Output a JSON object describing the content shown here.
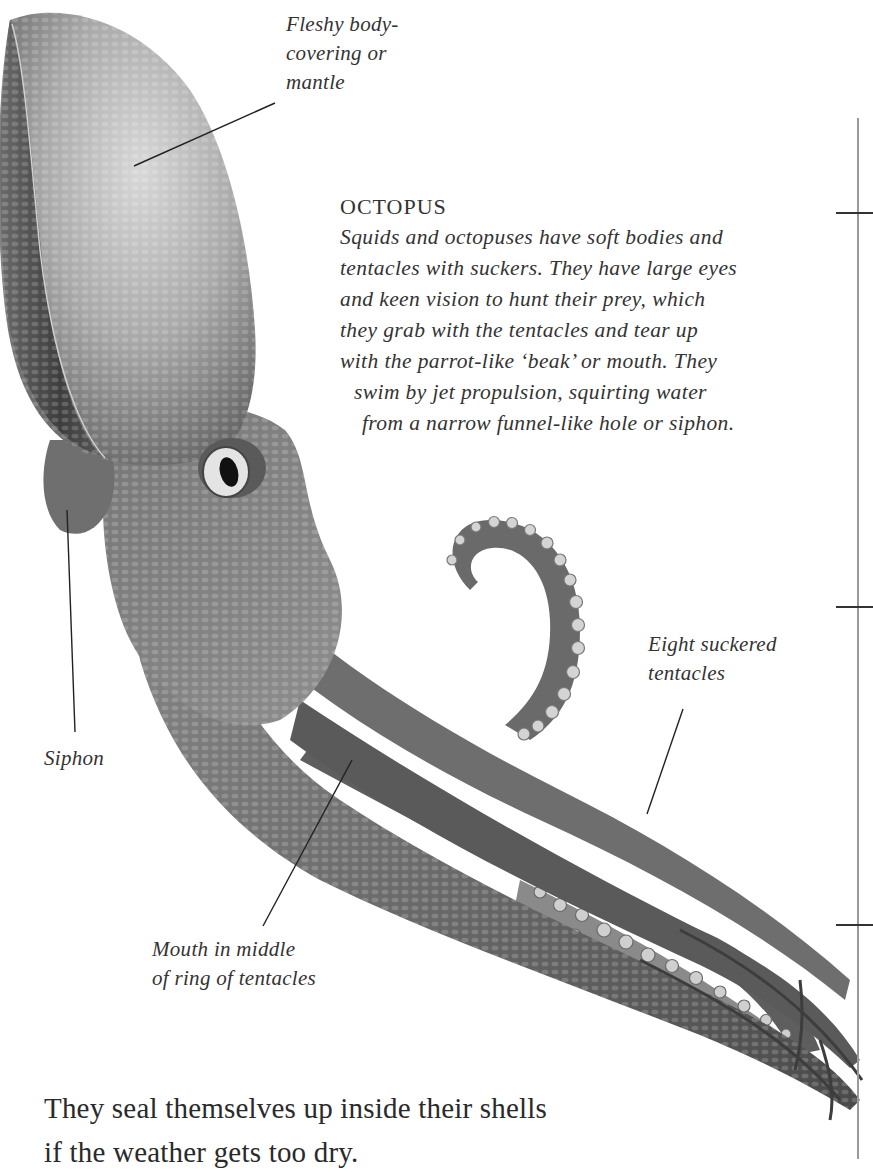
{
  "page": {
    "illustration": {
      "subject": "octopus-illustration",
      "labels": {
        "mantle": [
          "Fleshy body-",
          "covering or",
          "mantle"
        ],
        "eight_tentacles": [
          "Eight suckered",
          "tentacles"
        ],
        "siphon": [
          "Siphon"
        ],
        "mouth": [
          "Mouth in middle",
          "of ring of tentacles"
        ]
      }
    },
    "caption": {
      "title": "OCTOPUS",
      "lines": [
        "Squids and octopuses have soft bodies and",
        "tentacles with suckers. They have large eyes",
        "and keen vision to hunt their prey, which",
        "they grab with the tentacles and tear up",
        "with the parrot-like ‘beak’ or mouth. They",
        "swim by jet propulsion, squirting water",
        "from a narrow funnel-like hole or siphon."
      ]
    },
    "body_text": {
      "lines": [
        "They seal themselves up inside their shells",
        "if the weather gets too dry."
      ]
    },
    "margin_ticks_y": [
      212,
      606,
      924
    ]
  }
}
